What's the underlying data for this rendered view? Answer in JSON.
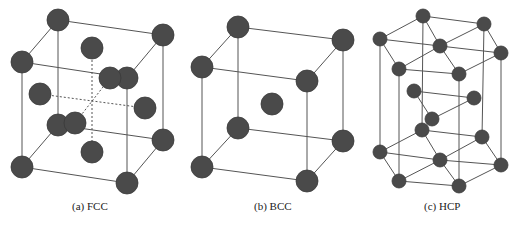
{
  "figure": {
    "background": "#ffffff",
    "atom_color": "#4a4a4a",
    "edge_color": "#555555",
    "panels": [
      {
        "id": "fcc",
        "caption": "(a) FCC",
        "caption_x": 72,
        "atom_radius": 11,
        "atoms": [
          [
            58,
            20
          ],
          [
            163,
            35
          ],
          [
            22,
            62
          ],
          [
            127,
            78
          ],
          [
            58,
            125
          ],
          [
            163,
            140
          ],
          [
            22,
            167
          ],
          [
            127,
            183
          ],
          [
            92,
            48
          ],
          [
            110,
            78
          ],
          [
            40,
            94
          ],
          [
            145,
            108
          ],
          [
            92,
            152
          ],
          [
            75,
            123
          ]
        ],
        "edges": [
          [
            0,
            1
          ],
          [
            0,
            2
          ],
          [
            1,
            3
          ],
          [
            2,
            3
          ],
          [
            4,
            5
          ],
          [
            4,
            6
          ],
          [
            5,
            7
          ],
          [
            6,
            7
          ],
          [
            0,
            4
          ],
          [
            1,
            5
          ],
          [
            2,
            6
          ],
          [
            3,
            7
          ]
        ],
        "dashed_edges": [
          [
            8,
            12
          ],
          [
            10,
            11
          ],
          [
            13,
            9
          ]
        ]
      },
      {
        "id": "bcc",
        "caption": "(b) BCC",
        "caption_x": 254,
        "atom_radius": 11,
        "atoms": [
          [
            238,
            27
          ],
          [
            343,
            40
          ],
          [
            202,
            67
          ],
          [
            307,
            81
          ],
          [
            238,
            128
          ],
          [
            343,
            141
          ],
          [
            202,
            167
          ],
          [
            307,
            181
          ],
          [
            272,
            104
          ]
        ],
        "edges": [
          [
            0,
            1
          ],
          [
            0,
            2
          ],
          [
            1,
            3
          ],
          [
            2,
            3
          ],
          [
            4,
            5
          ],
          [
            4,
            6
          ],
          [
            5,
            7
          ],
          [
            6,
            7
          ],
          [
            0,
            4
          ],
          [
            1,
            5
          ],
          [
            2,
            6
          ],
          [
            3,
            7
          ]
        ],
        "dashed_edges": []
      },
      {
        "id": "hcp",
        "caption": "(c) HCP",
        "caption_x": 424,
        "atom_radius": 7,
        "atoms": [
          [
            423,
            16
          ],
          [
            484,
            24
          ],
          [
            501,
            53
          ],
          [
            459,
            74
          ],
          [
            399,
            69
          ],
          [
            380,
            39
          ],
          [
            440,
            46
          ],
          [
            414,
            91
          ],
          [
            474,
            98
          ],
          [
            432,
            119
          ],
          [
            422,
            130
          ],
          [
            482,
            137
          ],
          [
            501,
            165
          ],
          [
            459,
            186
          ],
          [
            399,
            181
          ],
          [
            380,
            152
          ],
          [
            440,
            160
          ]
        ],
        "edges": [
          [
            0,
            1
          ],
          [
            1,
            2
          ],
          [
            2,
            3
          ],
          [
            3,
            4
          ],
          [
            4,
            5
          ],
          [
            5,
            0
          ],
          [
            6,
            0
          ],
          [
            6,
            1
          ],
          [
            6,
            2
          ],
          [
            6,
            3
          ],
          [
            6,
            4
          ],
          [
            6,
            5
          ],
          [
            7,
            8
          ],
          [
            8,
            9
          ],
          [
            9,
            7
          ],
          [
            10,
            11
          ],
          [
            11,
            12
          ],
          [
            12,
            13
          ],
          [
            13,
            14
          ],
          [
            14,
            15
          ],
          [
            15,
            10
          ],
          [
            16,
            10
          ],
          [
            16,
            11
          ],
          [
            16,
            12
          ],
          [
            16,
            13
          ],
          [
            16,
            14
          ],
          [
            16,
            15
          ],
          [
            0,
            10
          ],
          [
            1,
            11
          ],
          [
            2,
            12
          ],
          [
            3,
            13
          ],
          [
            4,
            14
          ],
          [
            5,
            15
          ]
        ],
        "dashed_edges": []
      }
    ]
  }
}
